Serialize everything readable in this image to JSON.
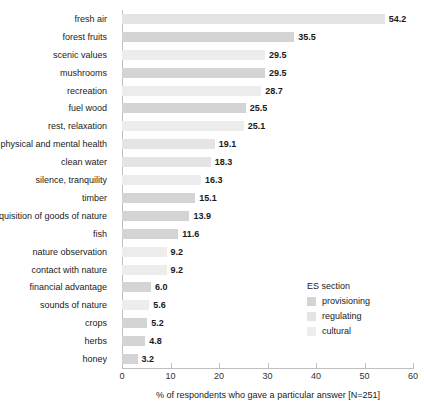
{
  "chart_data": {
    "type": "bar",
    "orientation": "horizontal",
    "title": "",
    "xlabel": "% of respondents who gave a particular answer [N=251]",
    "ylabel": "",
    "xlim": [
      0,
      60
    ],
    "xticks": [
      0,
      10,
      20,
      30,
      40,
      50,
      60
    ],
    "grid": false,
    "categories": [
      "fresh air",
      "forest fruits",
      "scenic values",
      "mushrooms",
      "recreation",
      "fuel wood",
      "rest, relaxation",
      "physical and mental health",
      "clean water",
      "silence, tranquility",
      "timber",
      "acquisition of goods of nature",
      "fish",
      "nature observation",
      "contact with nature",
      "financial advantage",
      "sounds of nature",
      "crops",
      "herbs",
      "honey"
    ],
    "values": [
      54.2,
      35.5,
      29.5,
      29.5,
      28.7,
      25.5,
      25.1,
      19.1,
      18.3,
      16.3,
      15.1,
      13.9,
      11.6,
      9.2,
      9.2,
      6.0,
      5.6,
      5.2,
      4.8,
      3.2
    ],
    "value_labels": [
      "54.2",
      "35.5",
      "29.5",
      "29.5",
      "28.7",
      "25.5",
      "25.1",
      "19.1",
      "18.3",
      "16.3",
      "15.1",
      "13.9",
      "11.6",
      "9.2",
      "9.2",
      "6.0",
      "5.6",
      "5.2",
      "4.8",
      "3.2"
    ],
    "groups": [
      "regulating",
      "provisioning",
      "cultural",
      "provisioning",
      "cultural",
      "provisioning",
      "cultural",
      "regulating",
      "regulating",
      "cultural",
      "provisioning",
      "provisioning",
      "provisioning",
      "cultural",
      "cultural",
      "provisioning",
      "cultural",
      "provisioning",
      "provisioning",
      "provisioning"
    ],
    "legend": {
      "title": "ES section",
      "position": "right",
      "entries": [
        {
          "label": "provisioning",
          "color": "#d4d4d4"
        },
        {
          "label": "regulating",
          "color": "#e4e4e4"
        },
        {
          "label": "cultural",
          "color": "#ededed"
        }
      ]
    },
    "colors": {
      "provisioning": "#d4d4d4",
      "regulating": "#e4e4e4",
      "cultural": "#ededed",
      "axis": "#bfbfbf"
    }
  }
}
